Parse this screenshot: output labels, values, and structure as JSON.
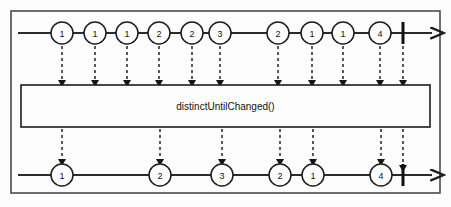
{
  "diagram": {
    "operator_label": "distinctUntilChanged()",
    "background_color": "#fdfdfd",
    "stroke_color": "#1c1c1c",
    "frame": {
      "x": 11,
      "y": 11,
      "width": 429,
      "height": 182
    },
    "operator_box": {
      "x": 21,
      "y": 85,
      "width": 409,
      "height": 42
    },
    "source_stream": {
      "name": "source-observable",
      "axis_y": 33,
      "axis_start_x": 18,
      "axis_end_x": 432,
      "marble_radius": 11,
      "complete_bar_x": 403,
      "marbles": [
        {
          "label": "1",
          "cx": 62
        },
        {
          "label": "1",
          "cx": 95
        },
        {
          "label": "1",
          "cx": 127
        },
        {
          "label": "2",
          "cx": 159
        },
        {
          "label": "2",
          "cx": 192
        },
        {
          "label": "3",
          "cx": 220
        },
        {
          "label": "2",
          "cx": 278
        },
        {
          "label": "1",
          "cx": 312
        },
        {
          "label": "1",
          "cx": 343
        },
        {
          "label": "4",
          "cx": 380
        }
      ]
    },
    "result_stream": {
      "name": "result-observable",
      "axis_y": 175,
      "axis_start_x": 18,
      "axis_end_x": 432,
      "marble_radius": 11,
      "complete_bar_x": 403,
      "marbles": [
        {
          "label": "1",
          "cx": 62
        },
        {
          "label": "2",
          "cx": 160
        },
        {
          "label": "3",
          "cx": 222
        },
        {
          "label": "2",
          "cx": 280
        },
        {
          "label": "1",
          "cx": 313
        },
        {
          "label": "4",
          "cx": 381
        }
      ]
    },
    "input_arrows": {
      "from_y": 46,
      "to_y": 83,
      "xs": [
        62,
        95,
        127,
        159,
        192,
        220,
        278,
        312,
        343,
        380,
        403
      ]
    },
    "output_arrows": {
      "from_y": 129,
      "to_y": 162,
      "xs": [
        62,
        160,
        222,
        280,
        313,
        381,
        403
      ]
    }
  }
}
